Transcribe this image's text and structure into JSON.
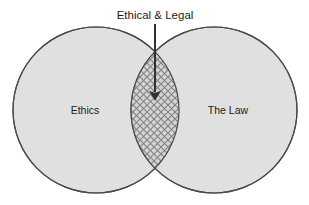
{
  "diagram": {
    "type": "venn-2set",
    "title": "Ethical & Legal",
    "background_color": "#ffffff",
    "sets": [
      {
        "id": "ethics",
        "label": "Ethics",
        "label_x": 85,
        "label_y": 114,
        "center_x": 96,
        "center_y": 110,
        "radius": 83,
        "fill_color": "#e0e0e0",
        "stroke_color": "#4a4a4a"
      },
      {
        "id": "the-law",
        "label": "The Law",
        "label_x": 228,
        "label_y": 114,
        "center_x": 214,
        "center_y": 110,
        "radius": 83,
        "fill_color": "#e0e0e0",
        "stroke_color": "#4a4a4a"
      }
    ],
    "intersection": {
      "id": "ethical-and-legal",
      "label": "Ethical & Legal",
      "fill_pattern": "crosshatch-diagonal",
      "fill_color": "#d2d2d2",
      "hatch_color": "#8a8a8a",
      "hatch_spacing": 7,
      "top_x": 155,
      "top_y": 57,
      "bottom_x": 155,
      "bottom_y": 164,
      "left_x": 132,
      "right_x": 179
    },
    "callout": {
      "label": "Ethical & Legal",
      "label_x": 155,
      "label_y": 18,
      "arrow_color": "#303030",
      "arrow_start_x": 155,
      "arrow_start_y": 24,
      "arrow_end_x": 155,
      "arrow_end_y": 100,
      "arrow_head_width": 9,
      "arrow_head_length": 13
    }
  }
}
